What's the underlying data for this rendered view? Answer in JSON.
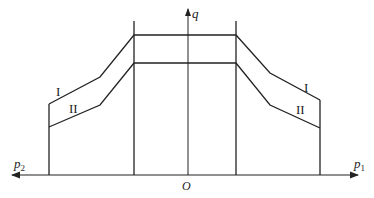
{
  "diagram": {
    "axes": {
      "vertical_label": "q",
      "left_label_base": "p",
      "left_label_sub": "2",
      "right_label_base": "p",
      "right_label_sub": "1",
      "origin_label": "O"
    },
    "curves": [
      {
        "label": "I",
        "points": [
          [
            49,
            104
          ],
          [
            100,
            77
          ],
          [
            134,
            35
          ],
          [
            236,
            35
          ],
          [
            270,
            73
          ],
          [
            320,
            100
          ]
        ]
      },
      {
        "label": "II",
        "points": [
          [
            49,
            127
          ],
          [
            100,
            105
          ],
          [
            134,
            63
          ],
          [
            236,
            63
          ],
          [
            270,
            105
          ],
          [
            320,
            128
          ]
        ]
      }
    ],
    "colors": {
      "line": "#222222",
      "background": "#ffffff"
    }
  }
}
